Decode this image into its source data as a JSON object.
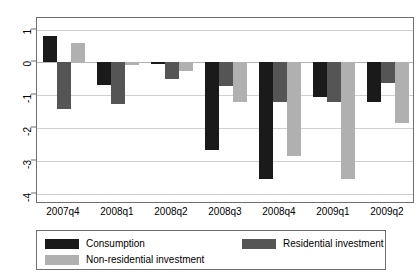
{
  "chart_data": {
    "type": "bar",
    "title": "",
    "subtitle": "",
    "xlabel": "",
    "ylabel": "",
    "categories": [
      "2007q4",
      "2008q1",
      "2008q2",
      "2008q3",
      "2008q4",
      "2009q1",
      "2009q2"
    ],
    "series": [
      {
        "name": "Consumption",
        "color": "#1a1a1a",
        "values": [
          0.8,
          -0.7,
          -0.06,
          -2.65,
          -3.55,
          -1.05,
          -1.2
        ]
      },
      {
        "name": "Residential investment",
        "color": "#555555",
        "values": [
          -1.4,
          -1.25,
          -0.5,
          -0.73,
          -1.2,
          -1.2,
          -0.62
        ]
      },
      {
        "name": "Non-residential investment",
        "color": "#b0b0b0",
        "values": [
          0.6,
          -0.08,
          -0.25,
          -1.2,
          -2.85,
          -3.55,
          -1.85
        ]
      }
    ],
    "ylim": [
      -4.3,
      1.35
    ],
    "yticks": [
      1,
      0,
      -1,
      -2,
      -3,
      -4
    ],
    "ytick_labels": [
      "1",
      "0",
      "-1",
      "-2",
      "-3",
      "-4"
    ],
    "grid": true,
    "legend_position": "bottom",
    "legend": [
      {
        "label": "Consumption",
        "color": "#1a1a1a"
      },
      {
        "label": "Residential investment",
        "color": "#555555"
      },
      {
        "label": "Non-residential investment",
        "color": "#b0b0b0"
      }
    ]
  }
}
